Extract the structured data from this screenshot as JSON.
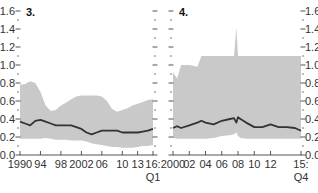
{
  "chart_data": [
    {
      "type": "area",
      "title": "3.",
      "xlabel": "",
      "ylabel": "",
      "ylim": [
        0.0,
        1.6
      ],
      "yticks": [
        "0.0",
        "0.2",
        "0.4",
        "0.6",
        "0.8",
        "1.0",
        "1.2",
        "1.4",
        "1.6"
      ],
      "xticks": [
        "1990",
        "94",
        "98",
        "2002",
        "06",
        "10",
        "13",
        "16:"
      ],
      "xticks_sub": "Q1",
      "grid": false,
      "legend": null,
      "x": [
        1990,
        1991,
        1992,
        1993,
        1994,
        1995,
        1996,
        1997,
        1998,
        1999,
        2000,
        2001,
        2002,
        2003,
        2004,
        2005,
        2006,
        2007,
        2008,
        2009,
        2010,
        2011,
        2012,
        2013,
        2014,
        2015,
        2016
      ],
      "series": [
        {
          "name": "median",
          "style": "line",
          "values": [
            0.37,
            0.35,
            0.33,
            0.38,
            0.39,
            0.37,
            0.35,
            0.33,
            0.33,
            0.33,
            0.33,
            0.31,
            0.29,
            0.25,
            0.23,
            0.25,
            0.27,
            0.27,
            0.27,
            0.27,
            0.25,
            0.25,
            0.25,
            0.25,
            0.26,
            0.27,
            0.29
          ]
        },
        {
          "name": "upper band",
          "style": "area",
          "values": [
            0.78,
            0.79,
            0.82,
            0.8,
            0.7,
            0.55,
            0.49,
            0.5,
            0.55,
            0.58,
            0.62,
            0.65,
            0.66,
            0.66,
            0.66,
            0.66,
            0.65,
            0.6,
            0.51,
            0.48,
            0.5,
            0.52,
            0.55,
            0.57,
            0.59,
            0.61,
            0.62
          ]
        },
        {
          "name": "lower band",
          "style": "area",
          "values": [
            0.18,
            0.18,
            0.18,
            0.18,
            0.18,
            0.19,
            0.18,
            0.17,
            0.17,
            0.17,
            0.16,
            0.16,
            0.16,
            0.15,
            0.13,
            0.12,
            0.11,
            0.1,
            0.09,
            0.09,
            0.08,
            0.08,
            0.08,
            0.09,
            0.1,
            0.1,
            0.11
          ]
        }
      ]
    },
    {
      "type": "area",
      "title": "4.",
      "xlabel": "",
      "ylabel": "",
      "ylim": [
        0.0,
        1.6
      ],
      "yticks": [
        "0.0",
        "0.2",
        "0.4",
        "0.6",
        "0.8",
        "1.0",
        "1.2",
        "1.4",
        "1.6"
      ],
      "xticks": [
        "2000",
        "02",
        "04",
        "06",
        "08",
        "10",
        "12",
        "15:"
      ],
      "xticks_sub": "Q4",
      "grid": false,
      "legend": null,
      "x": [
        2000,
        2000.5,
        2001,
        2002,
        2003,
        2003.5,
        2004,
        2005,
        2006,
        2007,
        2007.5,
        2007.8,
        2008,
        2008.3,
        2009,
        2010,
        2011,
        2012,
        2013,
        2014,
        2015,
        2015.75
      ],
      "series": [
        {
          "name": "median",
          "style": "line",
          "values": [
            0.3,
            0.32,
            0.3,
            0.33,
            0.36,
            0.38,
            0.36,
            0.34,
            0.38,
            0.4,
            0.41,
            0.36,
            0.42,
            0.4,
            0.36,
            0.31,
            0.31,
            0.34,
            0.31,
            0.31,
            0.3,
            0.27
          ]
        },
        {
          "name": "upper band",
          "style": "area",
          "values": [
            0.92,
            0.85,
            1.0,
            1.0,
            0.98,
            1.1,
            1.1,
            1.1,
            1.1,
            1.1,
            1.1,
            1.42,
            1.1,
            1.1,
            1.1,
            1.1,
            1.1,
            1.1,
            1.1,
            1.1,
            1.1,
            1.1
          ]
        },
        {
          "name": "lower band",
          "style": "area",
          "values": [
            0.19,
            0.18,
            0.18,
            0.18,
            0.18,
            0.18,
            0.18,
            0.19,
            0.21,
            0.22,
            0.23,
            0.25,
            0.21,
            0.19,
            0.18,
            0.18,
            0.18,
            0.18,
            0.18,
            0.18,
            0.18,
            0.18
          ]
        }
      ]
    }
  ],
  "colors": {
    "band": "#c9c9c9",
    "line": "#333333",
    "axis": "#555555"
  }
}
